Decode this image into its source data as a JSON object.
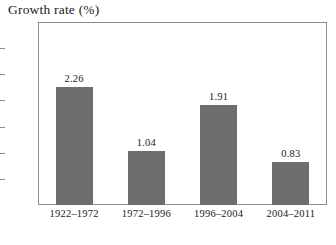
{
  "chart_data": {
    "type": "bar",
    "title": "Growth rate (%)",
    "xlabel": "",
    "ylabel": "",
    "categories": [
      "1922–1972",
      "1972–1996",
      "1996–2004",
      "2004–2011"
    ],
    "values": [
      2.26,
      1.04,
      1.91,
      0.83
    ],
    "value_labels": [
      "2.26",
      "1.04",
      "1.91",
      "0.83"
    ],
    "ylim": [
      0.0,
      3.5
    ],
    "ytick_values": [
      0.0,
      0.5,
      1.0,
      1.5,
      2.0,
      2.5,
      3.0,
      3.5
    ],
    "ytick_labels": [
      "0.00",
      "0.50",
      "1.00",
      "1.50",
      "2.00",
      "2.50",
      "3.00",
      "3.50"
    ],
    "grid": false,
    "legend": false,
    "legend_position": "none",
    "bar_color": "#6e6e6e",
    "frame_color": "#8d8d8d",
    "text_color": "#1a1a1a",
    "background_color": "#ffffff"
  }
}
